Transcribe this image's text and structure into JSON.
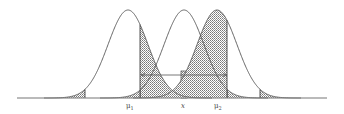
{
  "diagram": {
    "title": "",
    "colors": {
      "stroke": "#555555",
      "hatch": "#888888",
      "background": "#ffffff"
    },
    "labels": {
      "mu1": "μ",
      "mu1_sub": "1",
      "x": "x",
      "mu2": "μ",
      "mu2_sub": "2"
    },
    "curves": [
      {
        "name": "distribution-mu1",
        "peak_x": 128,
        "sigma_px": 20,
        "left_cut": 85,
        "right_cut": 140
      },
      {
        "name": "distribution-x",
        "peak_x": 184,
        "sigma_px": 20,
        "left_cut": 140,
        "right_cut": 227,
        "center_strip": [
          181,
          187
        ]
      },
      {
        "name": "distribution-mu2",
        "peak_x": 217,
        "sigma_px": 20,
        "left_cut": 227,
        "right_cut": 260
      }
    ],
    "axis": {
      "x_start": 17,
      "x_end": 327,
      "y": 98
    },
    "arrow": {
      "x_start": 141,
      "x_end": 227,
      "y": 75,
      "double_headed": true
    }
  }
}
